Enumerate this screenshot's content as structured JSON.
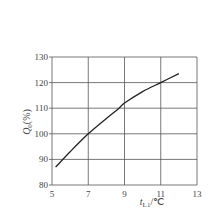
{
  "chart_data": {
    "type": "line",
    "title": "",
    "xlabel": "t_L1/°C",
    "ylabel": "Q_0(%)",
    "xlim": [
      5,
      13
    ],
    "ylim": [
      80,
      130
    ],
    "x_ticks": [
      "5",
      "7",
      "9",
      "11",
      "13"
    ],
    "y_ticks": [
      "80",
      "90",
      "100",
      "110",
      "120",
      "130"
    ],
    "grid": true,
    "legend": null,
    "series": [
      {
        "name": "Q_0",
        "x": [
          5.2,
          6,
          7,
          8,
          8.7,
          9,
          10,
          11,
          12
        ],
        "values": [
          87,
          93,
          100,
          106,
          110,
          112,
          116.5,
          120,
          123.5
        ]
      }
    ]
  },
  "labels": {
    "x_main": "t",
    "x_sub": "L1",
    "x_unit": "/℃",
    "y_main": "Q",
    "y_sub": "0",
    "y_unit": "(%)"
  }
}
